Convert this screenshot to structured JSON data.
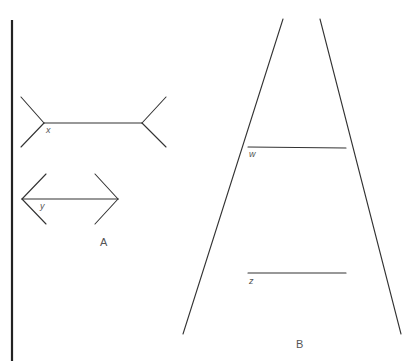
{
  "figure": {
    "colors": {
      "background": "#ffffff",
      "line": "#333333",
      "divider": "#222222",
      "label": "#555555"
    },
    "divider": {
      "x": 12,
      "y1": 20,
      "y2": 361
    },
    "panel_a": {
      "label": "A",
      "label_pos": [
        100,
        246
      ],
      "line_x": {
        "label": "x",
        "label_pos": [
          46,
          133
        ],
        "shaft": [
          44,
          123,
          142,
          123
        ],
        "fins": [
          [
            44,
            123,
            21,
            97
          ],
          [
            44,
            123,
            21,
            147
          ],
          [
            142,
            123,
            166,
            97
          ],
          [
            142,
            123,
            166,
            147
          ]
        ]
      },
      "line_y": {
        "label": "y",
        "label_pos": [
          40,
          209
        ],
        "shaft": [
          22,
          199,
          118,
          199
        ],
        "fins": [
          [
            22,
            199,
            46,
            174
          ],
          [
            22,
            199,
            46,
            224
          ],
          [
            118,
            199,
            95,
            174
          ],
          [
            118,
            199,
            95,
            224
          ]
        ]
      }
    },
    "panel_b": {
      "label": "B",
      "label_pos": [
        296,
        348
      ],
      "rails": [
        [
          283,
          19,
          183,
          334
        ],
        [
          320,
          19,
          401,
          334
        ]
      ],
      "line_w": {
        "label": "w",
        "label_pos": [
          249,
          157
        ],
        "segment": [
          248,
          147,
          346,
          148
        ]
      },
      "line_z": {
        "label": "z",
        "label_pos": [
          249,
          284
        ],
        "segment": [
          248,
          273,
          346,
          273
        ]
      }
    }
  }
}
